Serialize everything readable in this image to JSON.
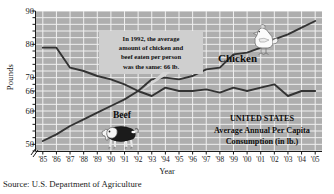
{
  "chart_data": {
    "type": "line",
    "title": "UNITED STATES Average Annual Per Capita Consumption (in lb.)",
    "xlabel": "Year",
    "ylabel": "Pounds",
    "categories": [
      "'85",
      "'86",
      "'87",
      "'88",
      "'89",
      "'90",
      "'91",
      "'92",
      "'93",
      "'94",
      "'95",
      "'96",
      "'97",
      "'98",
      "'99",
      "'00",
      "'01",
      "'02",
      "'03",
      "'04",
      "'05"
    ],
    "x_values": [
      1985,
      1986,
      1987,
      1988,
      1989,
      1990,
      1991,
      1992,
      1993,
      1994,
      1995,
      1996,
      1997,
      1998,
      1999,
      2000,
      2001,
      2002,
      2003,
      2004,
      2005
    ],
    "ylim": [
      48,
      90
    ],
    "xlim": [
      1984.5,
      2005.5
    ],
    "y_ticks": [
      50,
      60,
      66,
      70,
      80,
      90
    ],
    "grid": true,
    "axis_break": true,
    "legend_position": "inline-labels",
    "series": [
      {
        "name": "Beef",
        "color": "#333333",
        "values": [
          79,
          79,
          73,
          72,
          70.5,
          69.5,
          68,
          66,
          64.5,
          67,
          66,
          66,
          66.5,
          65.5,
          67,
          66,
          67,
          68,
          64.5,
          66,
          66
        ]
      },
      {
        "name": "Chicken",
        "color": "#333333",
        "values": [
          51,
          53,
          55.5,
          57.5,
          59.5,
          61.5,
          63.5,
          66,
          69.5,
          70,
          69.5,
          70.5,
          72.5,
          73,
          77,
          77.5,
          79,
          81.5,
          83,
          85,
          87
        ]
      }
    ],
    "annotations": [
      {
        "name": "crossing-callout",
        "lines": [
          "In 1992, the average",
          "amount of chicken and",
          "beef eaten per person",
          "was the same: 66 lb."
        ],
        "target_year": 1992,
        "target_value": 66
      }
    ]
  },
  "axis": {
    "ylabel": "Pounds",
    "xlabel": "Year",
    "y_ticks": [
      "90",
      "80",
      "70",
      "66",
      "60",
      "50"
    ],
    "x_ticks": [
      "'85",
      "'86",
      "'87",
      "'88",
      "'89",
      "'90",
      "'91",
      "'92",
      "'93",
      "'94",
      "'95",
      "'96",
      "'97",
      "'98",
      "'99",
      "'00",
      "'01",
      "'02",
      "'03",
      "'04",
      "'05"
    ]
  },
  "callout": {
    "line1": "In 1992, the average",
    "line2": "amount of chicken and",
    "line3": "beef eaten per person",
    "line4": "was the same: 66 lb."
  },
  "series_labels": {
    "chicken": "Chicken",
    "beef": "Beef"
  },
  "title_block": {
    "line1": "UNITED STATES",
    "line2": "Average Annual Per Capita",
    "line3": "Consumption (in lb.)"
  },
  "source": {
    "text": "Source: U.S. Department of Agriculture"
  },
  "icons": {
    "chicken": "chicken-illustration",
    "cow": "cow-illustration"
  },
  "colors": {
    "plot_background": "#aeaeae",
    "gridline": "#f0f0f0",
    "line": "#333333",
    "callout_background": "#cfcfcf",
    "text": "#1a1a1a"
  }
}
